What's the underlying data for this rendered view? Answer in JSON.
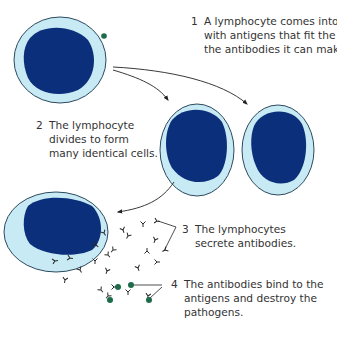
{
  "colors": {
    "cytoplasm": "#c8eaf4",
    "nucleus": "#0b2f7a",
    "outline": "#2c4a5e",
    "antigen": "#1e6b4a",
    "antibody": "#2a2a2a",
    "text": "#333333"
  },
  "steps": [
    {
      "number": "1",
      "lines": [
        "A lymphocyte comes into contact",
        "with antigens that fit the shape of",
        "the antibodies it can make."
      ]
    },
    {
      "number": "2",
      "lines": [
        "The lymphocyte",
        "divides to form",
        "many identical cells."
      ]
    },
    {
      "number": "3",
      "lines": [
        "The lymphocytes",
        "secrete antibodies."
      ]
    },
    {
      "number": "4",
      "lines": [
        "The antibodies bind to the",
        "antigens and destroy the",
        "pathogens."
      ]
    }
  ]
}
